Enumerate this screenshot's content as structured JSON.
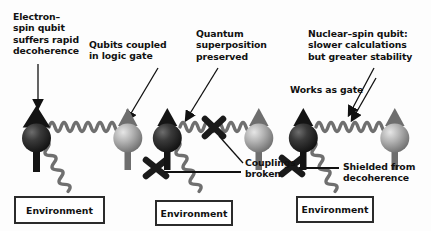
{
  "figure": {
    "background_color": "#fdfdfd",
    "text_color": "#111111",
    "panels": [
      {
        "id": "panel-electron-spin",
        "caption": "Electron–\nspin qubit\nsuffers rapid\ndecoherence",
        "secondary_caption": "Qubits coupled\nin logic gate",
        "environment_label": "Environment",
        "coupling_intact": true,
        "environment_coupling_intact": true
      },
      {
        "id": "panel-superposition",
        "caption": "Quantum\nsuperposition\npreserved",
        "secondary_caption": "Couplings\nbroken",
        "environment_label": "Environment",
        "coupling_intact": false,
        "environment_coupling_intact": false
      },
      {
        "id": "panel-nuclear-spin",
        "caption": "Nuclear–spin qubit:\nslower calculations\nbut greater stability",
        "secondary_caption": "Works as gate",
        "tertiary_caption": "Shielded from\ndecoherence",
        "environment_label": "Environment",
        "coupling_intact": true,
        "environment_coupling_intact": false
      }
    ],
    "colors": {
      "dark_sphere": "#1c1c1c",
      "light_sphere": "#9a9a9a",
      "arrow_dark": "#141414",
      "arrow_light": "#6e6e6e",
      "wave": "#6f6f6f",
      "cross": "#1a1a1a",
      "box_border": "#2b2b2b"
    }
  }
}
